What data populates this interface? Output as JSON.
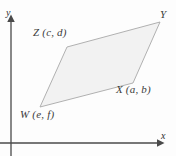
{
  "figure": {
    "kind": "geometry-diagram",
    "background_color": "#fdfdfd",
    "shape": {
      "name": "parallelogram-WXYZ",
      "fill_color": "#f2f2f2",
      "stroke_color": "#a8a8a8",
      "points": "67,47 160,22 133,83 40,107"
    },
    "axes": {
      "color": "#4a4a4a",
      "origin_x": 11,
      "origin_y": 143,
      "x_label": "x",
      "y_label": "y"
    },
    "vertices": [
      {
        "id": "Z",
        "label": "Z (c, d)",
        "x": 67,
        "y": 47
      },
      {
        "id": "Y",
        "label": "Y",
        "x": 160,
        "y": 22
      },
      {
        "id": "X",
        "label": "X (a, b)",
        "x": 133,
        "y": 83
      },
      {
        "id": "W",
        "label": "W (e, f)",
        "x": 40,
        "y": 107
      }
    ]
  }
}
